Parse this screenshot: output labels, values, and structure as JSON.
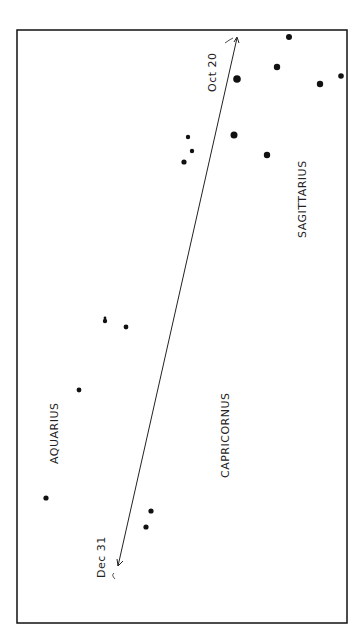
{
  "chart": {
    "title": "",
    "constellations": [
      {
        "name": "SAGITTARIUS"
      },
      {
        "name": "CAPRICORNUS"
      },
      {
        "name": "AQUARIUS"
      }
    ],
    "path": {
      "start_label": "Oct 20",
      "end_label": "Dec 31"
    },
    "colors": {
      "ink": "#111111",
      "background": "#ffffff"
    }
  }
}
